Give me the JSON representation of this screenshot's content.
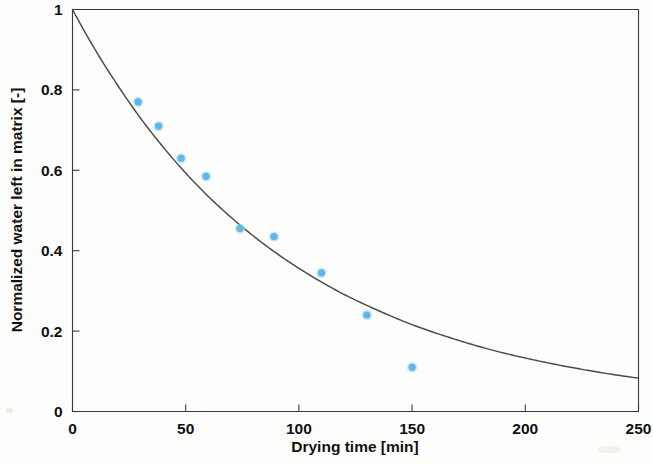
{
  "chart_data": {
    "type": "scatter",
    "title": "",
    "xlabel": "Drying time [min]",
    "ylabel": "Normalized water left in matrix [-]",
    "xlim": [
      0,
      250
    ],
    "ylim": [
      0,
      1
    ],
    "xticks": [
      0,
      50,
      100,
      150,
      200,
      250
    ],
    "yticks": [
      0,
      0.2,
      0.4,
      0.6,
      0.8,
      1
    ],
    "xticklabels": [
      "0",
      "50",
      "100",
      "150",
      "200",
      "250"
    ],
    "yticklabels": [
      "0",
      "0.2",
      "0.4",
      "0.6",
      "0.8",
      "1"
    ],
    "grid": false,
    "legend": null,
    "colors": {
      "marker": "#5cb8e6",
      "curve": "#4a4a4a",
      "axis": "#3a3a3a",
      "background": "#fdfdfc"
    },
    "series": [
      {
        "name": "Measured data",
        "type": "scatter",
        "marker": "circle",
        "color": "#5cb8e6",
        "x": [
          29,
          38,
          48,
          59,
          74,
          89,
          110,
          130,
          150
        ],
        "y": [
          0.77,
          0.71,
          0.63,
          0.585,
          0.455,
          0.435,
          0.345,
          0.24,
          0.11
        ]
      },
      {
        "name": "Model fit (exponential decay)",
        "type": "line",
        "color": "#4a4a4a",
        "x": [
          0,
          10,
          20,
          30,
          40,
          50,
          60,
          70,
          80,
          90,
          100,
          110,
          120,
          130,
          140,
          150,
          160,
          170,
          180,
          190,
          200,
          210,
          220,
          230,
          240,
          250
        ],
        "y": [
          1.0,
          0.9,
          0.811,
          0.73,
          0.658,
          0.593,
          0.535,
          0.483,
          0.436,
          0.394,
          0.356,
          0.322,
          0.291,
          0.264,
          0.239,
          0.216,
          0.196,
          0.178,
          0.161,
          0.146,
          0.133,
          0.121,
          0.11,
          0.1,
          0.091,
          0.083
        ]
      }
    ]
  },
  "axes": {
    "x_title": "Drying time [min]",
    "y_title": "Normalized water left in matrix [-]"
  }
}
